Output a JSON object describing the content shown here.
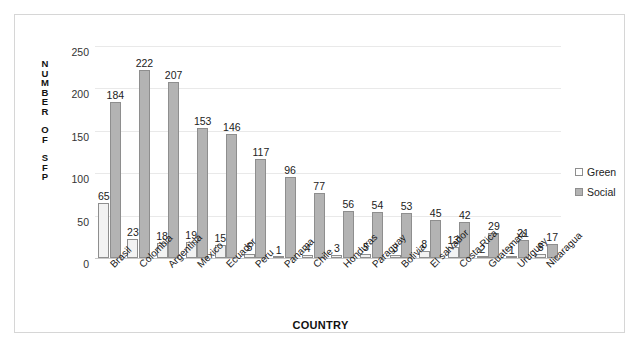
{
  "chart_data": {
    "type": "bar",
    "title": "",
    "xlabel": "COUNTRY",
    "ylabel": "NUMBER OF SFP",
    "ylim": [
      0,
      250
    ],
    "yticks": [
      0,
      50,
      100,
      150,
      200,
      250
    ],
    "grid": true,
    "legend_position": "right",
    "categories": [
      "Brasil",
      "Colombia",
      "Argentina",
      "Mexico",
      "Ecuador",
      "Peru",
      "Panama",
      "Chile",
      "Honduras",
      "Paraguay",
      "Bolivia",
      "El salvador",
      "Costa Rica",
      "Guatemala",
      "Uruguay",
      "Nicaragua"
    ],
    "series": [
      {
        "name": "Green",
        "color": "#f2f2f2",
        "values": [
          65,
          23,
          18,
          19,
          15,
          5,
          1,
          4,
          3,
          5,
          3,
          8,
          13,
          2,
          1,
          5
        ]
      },
      {
        "name": "Social",
        "color": "#b3b3b3",
        "values": [
          184,
          222,
          207,
          153,
          146,
          117,
          96,
          77,
          56,
          54,
          53,
          45,
          42,
          29,
          21,
          17
        ]
      }
    ]
  },
  "axis": {
    "y_caption_letters": [
      "N",
      "U",
      "M",
      "B",
      "E",
      "R",
      "gap",
      "O",
      "F",
      "gap",
      "S",
      "F",
      "P"
    ]
  }
}
